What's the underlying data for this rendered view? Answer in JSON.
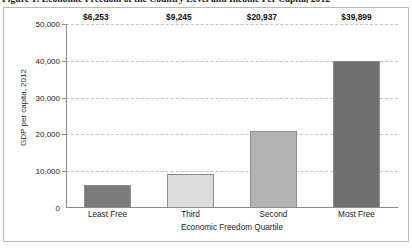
{
  "figure": {
    "caption": "Figure 1: Economic Freedom of the Country Level and Income Per Capita, 2012"
  },
  "chart_data": {
    "type": "bar",
    "title": "Figure 1: Economic Freedom of the Country Level and Income Per Capita, 2012",
    "categories": [
      "Least Free",
      "Third",
      "Second",
      "Most Free"
    ],
    "values": [
      6253,
      9245,
      20937,
      39899
    ],
    "value_labels": [
      "$6,253",
      "$9,245",
      "$20,937",
      "$39,899"
    ],
    "xlabel": "Economic Freedom Quartile",
    "ylabel": "GDP per capita, 2012",
    "ylim": [
      0,
      50000
    ],
    "ytick_values": [
      0,
      10000,
      20000,
      30000,
      40000,
      50000
    ],
    "ytick_labels": [
      "0",
      "10,000",
      "20,000",
      "30,000",
      "40,000",
      "50,000"
    ],
    "grid": true,
    "grid_style": "dashed",
    "legend": false,
    "bar_colors": [
      "#7b7b7b",
      "#dcdcdc",
      "#b3b3b3",
      "#6f6f6f"
    ],
    "bar_edge_color": "#8d8d8d",
    "axis_color": "#8a8a8a",
    "grid_color": "#c4c4c4",
    "frame_color": "#b9b9b9",
    "background": "#ffffff",
    "text_color": "#1a1a1a"
  }
}
